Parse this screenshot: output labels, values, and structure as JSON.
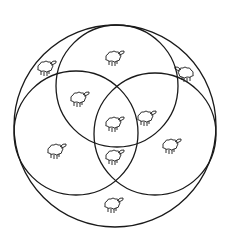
{
  "diagram": {
    "type": "venn-3-in-universe",
    "stroke_color": "#1a1a1a",
    "background": "#ffffff",
    "universe": {
      "cx": 115,
      "cy": 126,
      "r": 101
    },
    "sets": [
      {
        "name": "top",
        "cx": 117,
        "cy": 86,
        "r": 61
      },
      {
        "name": "left",
        "cx": 76,
        "cy": 133,
        "r": 62
      },
      {
        "name": "right",
        "cx": 155,
        "cy": 134,
        "r": 61
      }
    ],
    "animals": [
      {
        "region": "top-only",
        "x": 113,
        "y": 58,
        "dir": 1
      },
      {
        "region": "outside-top-left",
        "x": 45,
        "y": 68,
        "dir": 1
      },
      {
        "region": "outside-top-right",
        "x": 186,
        "y": 74,
        "dir": -1
      },
      {
        "region": "top-left",
        "x": 78,
        "y": 99,
        "dir": 1
      },
      {
        "region": "center",
        "x": 113,
        "y": 124,
        "dir": 1
      },
      {
        "region": "top-right",
        "x": 145,
        "y": 118,
        "dir": 1
      },
      {
        "region": "left-only",
        "x": 55,
        "y": 151,
        "dir": 1
      },
      {
        "region": "right-only",
        "x": 170,
        "y": 146,
        "dir": 1
      },
      {
        "region": "left-right",
        "x": 113,
        "y": 157,
        "dir": 1
      },
      {
        "region": "outside-bottom",
        "x": 112,
        "y": 205,
        "dir": 1
      }
    ]
  }
}
